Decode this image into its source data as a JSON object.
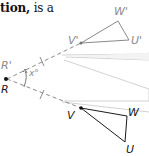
{
  "caption": {
    "bold_part": "tion,",
    "regular_part": " is a"
  },
  "figure": {
    "center": {
      "label_image": "R'",
      "label_preimage": "R"
    },
    "angle_label": "x°",
    "preimage": {
      "vertices": [
        "V",
        "W",
        "U"
      ]
    },
    "image": {
      "vertices": [
        "V'",
        "W'",
        "U'"
      ]
    },
    "colors": {
      "preimage_stroke": "#1a1a1a",
      "image_stroke": "#8a8a8a",
      "dashed_ray": "#9a9a9a",
      "wedge_stroke": "#d0d0d0"
    }
  }
}
